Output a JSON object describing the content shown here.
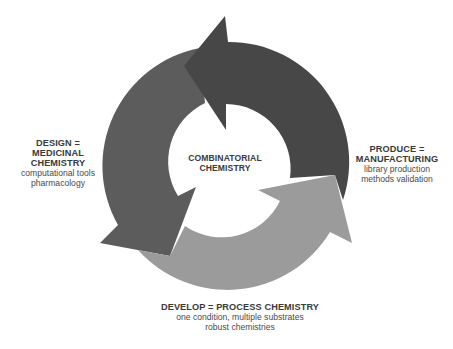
{
  "diagram": {
    "type": "cycle",
    "center": {
      "lines": [
        "COMBINATORIAL",
        "CHEMISTRY"
      ]
    },
    "stages": [
      {
        "id": "design",
        "title_lines": [
          "DESIGN =",
          "MEDICINAL",
          "CHEMISTRY"
        ],
        "detail_lines": [
          "computational tools",
          "pharmacology"
        ],
        "arrow_color": "#5c5c5c",
        "position": "left"
      },
      {
        "id": "develop",
        "title_lines": [
          "DEVELOP = PROCESS CHEMISTRY"
        ],
        "detail_lines": [
          "one condition, multiple substrates",
          "robust chemistries"
        ],
        "arrow_color": "#9b9b9b",
        "position": "bottom"
      },
      {
        "id": "produce",
        "title_lines": [
          "PRODUCE =",
          "MANUFACTURING"
        ],
        "detail_lines": [
          "library production",
          "methods validation"
        ],
        "arrow_color": "#474747",
        "position": "right"
      }
    ],
    "flow": [
      "design",
      "develop",
      "produce",
      "design"
    ],
    "colors": {
      "dark_arrow": "#474747",
      "medium_arrow": "#5c5c5c",
      "light_arrow": "#9b9b9b",
      "background": "#ffffff",
      "text": "#3a3a3a"
    }
  }
}
